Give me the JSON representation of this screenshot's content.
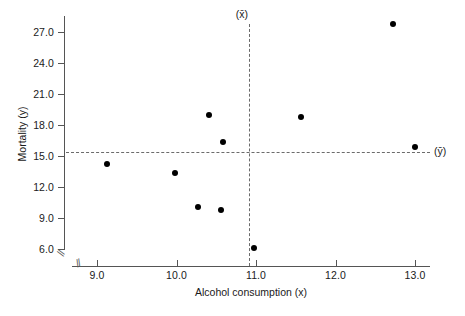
{
  "chart_data": {
    "type": "scatter",
    "title": "",
    "xlabel": "Alcohol consumption (x)",
    "ylabel": "Mortality (y)",
    "xlim": [
      8.55,
      13.35
    ],
    "ylim": [
      4.6,
      29.2
    ],
    "grid": false,
    "legend": "none",
    "x_ticks": [
      "9.0",
      "10.0",
      "11.0",
      "12.0",
      "13.0"
    ],
    "x_tick_values": [
      9.0,
      10.0,
      11.0,
      12.0,
      13.0
    ],
    "y_ticks": [
      "6.0",
      "9.0",
      "12.0",
      "15.0",
      "18.0",
      "21.0",
      "24.0",
      "27.0"
    ],
    "y_tick_values": [
      6.0,
      9.0,
      12.0,
      15.0,
      18.0,
      21.0,
      24.0,
      27.0
    ],
    "axis_break_x": true,
    "axis_break_y": true,
    "points": [
      {
        "x": 9.13,
        "y": 14.2
      },
      {
        "x": 9.98,
        "y": 13.4
      },
      {
        "x": 10.27,
        "y": 10.1
      },
      {
        "x": 10.41,
        "y": 19.0
      },
      {
        "x": 10.56,
        "y": 9.8
      },
      {
        "x": 10.59,
        "y": 16.4
      },
      {
        "x": 10.98,
        "y": 6.05
      },
      {
        "x": 11.56,
        "y": 18.8
      },
      {
        "x": 12.72,
        "y": 27.8
      },
      {
        "x": 13.0,
        "y": 15.9
      }
    ],
    "reference_lines": [
      {
        "name": "x-mean",
        "orientation": "vertical",
        "value": 10.91,
        "label": "(x̄)",
        "style": "dashed"
      },
      {
        "name": "y-mean",
        "orientation": "horizontal",
        "value": 15.4,
        "label": "(ȳ)",
        "style": "dashed"
      }
    ],
    "annotations": {
      "mean_x_label": "(x̄)",
      "mean_y_label": "(ȳ)",
      "break_glyph": "//"
    },
    "colors": {
      "point": "#000000",
      "axis": "#555555",
      "dashed_line": "#6b6b6b",
      "background": "#ffffff"
    }
  }
}
